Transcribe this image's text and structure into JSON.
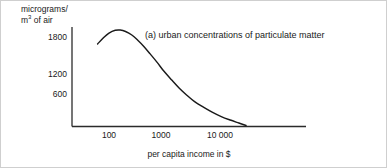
{
  "chart_data": {
    "type": "line",
    "title": "(a) urban concentrations of particulate matter",
    "xlabel": "per capita income in $",
    "ylabel": "micrograms/ m3 of air",
    "ylabel_line1": "micrograms/",
    "ylabel_line2_prefix": "m",
    "ylabel_line2_sup": "3",
    "ylabel_line2_suffix": " of air",
    "xscale": "log",
    "xtick_labels": [
      "100",
      "1000",
      "10 000"
    ],
    "xtick_values": [
      100,
      1000,
      10000
    ],
    "ytick_labels": [
      "1800",
      "1200",
      "600"
    ],
    "ytick_values": [
      1800,
      1200,
      600
    ],
    "xlim": [
      60,
      40000
    ],
    "ylim": [
      0,
      2100
    ],
    "grid": false,
    "legend": "none",
    "series": [
      {
        "name": "urban concentrations of particulate matter",
        "color": "#1a1a1a",
        "x": [
          62,
          80,
          100,
          130,
          160,
          200,
          260,
          330,
          430,
          560,
          750,
          1000,
          1400,
          1900,
          2600,
          3600,
          5200,
          7500,
          11000,
          16000,
          23000,
          31000
        ],
        "y": [
          1660,
          1790,
          1880,
          1935,
          1940,
          1910,
          1840,
          1740,
          1610,
          1460,
          1290,
          1110,
          930,
          770,
          630,
          500,
          390,
          290,
          200,
          130,
          70,
          20
        ]
      }
    ]
  },
  "caption": {
    "text": "(a) urban concentrations of particulate matter"
  }
}
